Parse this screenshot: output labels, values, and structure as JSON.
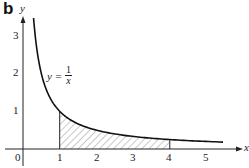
{
  "panel_label": "b",
  "chart_data": {
    "type": "line",
    "title": "",
    "xlabel": "x",
    "ylabel": "y",
    "xlim": [
      0,
      5.6
    ],
    "ylim": [
      0,
      3.5
    ],
    "x_ticks": [
      "0",
      "1",
      "2",
      "3",
      "4",
      "5"
    ],
    "y_ticks": [
      "1",
      "2",
      "3"
    ],
    "grid": false,
    "series": [
      {
        "name": "y = 1/x",
        "function": "1/x",
        "x": [
          0.17,
          0.25,
          0.5,
          1,
          1.5,
          2,
          3,
          4,
          5,
          5.45
        ],
        "values": [
          5.88,
          4.0,
          2.0,
          1.0,
          0.667,
          0.5,
          0.333,
          0.25,
          0.2,
          0.183
        ]
      }
    ],
    "shaded_region": {
      "from_x": 1,
      "to_x": 4,
      "under": "y = 1/x",
      "pattern": "diagonal hatch"
    },
    "annotations": [
      {
        "text": "y = 1/x",
        "x": 0.7,
        "y": 2
      }
    ]
  },
  "labels": {
    "x_axis": "x",
    "y_axis": "y",
    "origin": "0",
    "x_tick_1": "1",
    "x_tick_2": "2",
    "x_tick_3": "3",
    "x_tick_4": "4",
    "x_tick_5": "5",
    "y_tick_1": "1",
    "y_tick_2": "2",
    "y_tick_3": "3",
    "curve_eq_lhs": "y =",
    "curve_eq_num": "1",
    "curve_eq_den": "x"
  }
}
